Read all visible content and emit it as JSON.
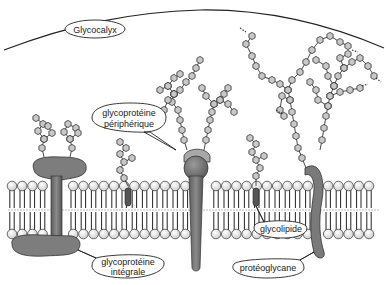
{
  "diagram": {
    "type": "cell-membrane",
    "colors": {
      "membrane_head": "#e6e6e6",
      "sugar": "#c8c8c8",
      "protein": "#7a7a7a",
      "protein_dark": "#5e5e5e",
      "cap": "#a8a8a8",
      "stroke": "#333333"
    },
    "labels": {
      "glycocalyx": "Glycocalyx",
      "peripheral_glycoprotein_line1": "glycoprotéine",
      "peripheral_glycoprotein_line2": "périphérique",
      "integral_glycoprotein_line1": "glycoprotéine",
      "integral_glycoprotein_line2": "intégrale",
      "glycolipid": "glycolipide",
      "proteoglycan": "protéoglycane"
    }
  }
}
